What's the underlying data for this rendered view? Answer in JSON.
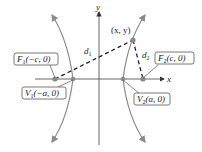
{
  "diagram": {
    "type": "hyperbola",
    "axes": {
      "x_label": "x",
      "y_label": "y"
    },
    "point": {
      "label": "(x, y)"
    },
    "distances": {
      "d1": "d",
      "d1_sub": "1",
      "d2": "d",
      "d2_sub": "2"
    },
    "foci": [
      {
        "name": "F",
        "sub": "1",
        "coords": "(−c, 0)"
      },
      {
        "name": "F",
        "sub": "2",
        "coords": "(c, 0)"
      }
    ],
    "vertices": [
      {
        "name": "V",
        "sub": "1",
        "coords": "(−a, 0)"
      },
      {
        "name": "V",
        "sub": "2",
        "coords": "(a, 0)"
      }
    ],
    "colors": {
      "curve": "#8a8a8a",
      "axis": "#555555",
      "dashed": "#222222",
      "point": "#8a8a8a"
    }
  }
}
